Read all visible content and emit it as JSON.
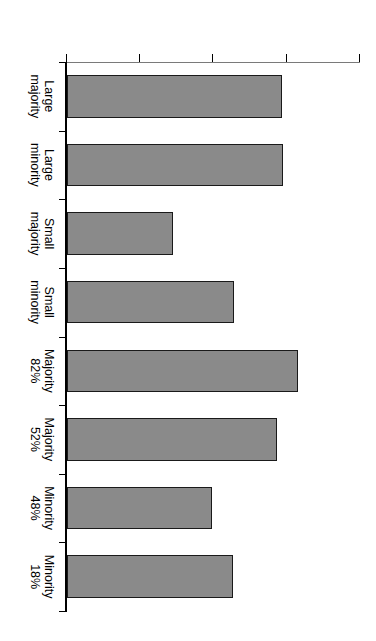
{
  "chart_data": {
    "type": "bar",
    "title": "",
    "xlabel": "",
    "ylabel": "Agreement with source",
    "categories": [
      "Large\nmajority",
      "Large\nminority",
      "Small\nmajority",
      "Small\nminority",
      "Majority 82%",
      "Majority 52%",
      "Minority 48%",
      "Minority 18%"
    ],
    "values": [
      4.93,
      4.95,
      3.45,
      4.28,
      5.15,
      4.87,
      3.98,
      4.27
    ],
    "ylim": [
      2,
      6
    ],
    "yticks": [
      2,
      3,
      4,
      5,
      6
    ],
    "ytick_labels": [
      "2",
      "3",
      "4",
      "5",
      "6"
    ],
    "grid": false,
    "legend": null,
    "bar_color": "#8a8a8a",
    "bar_edge_color": "#1a1a1a",
    "background_color": "#ffffff",
    "orientation": "vertical-bars-figure-rotated-90"
  },
  "figure": {
    "rotation_note": "90",
    "axis_title": "Agreement with source"
  }
}
